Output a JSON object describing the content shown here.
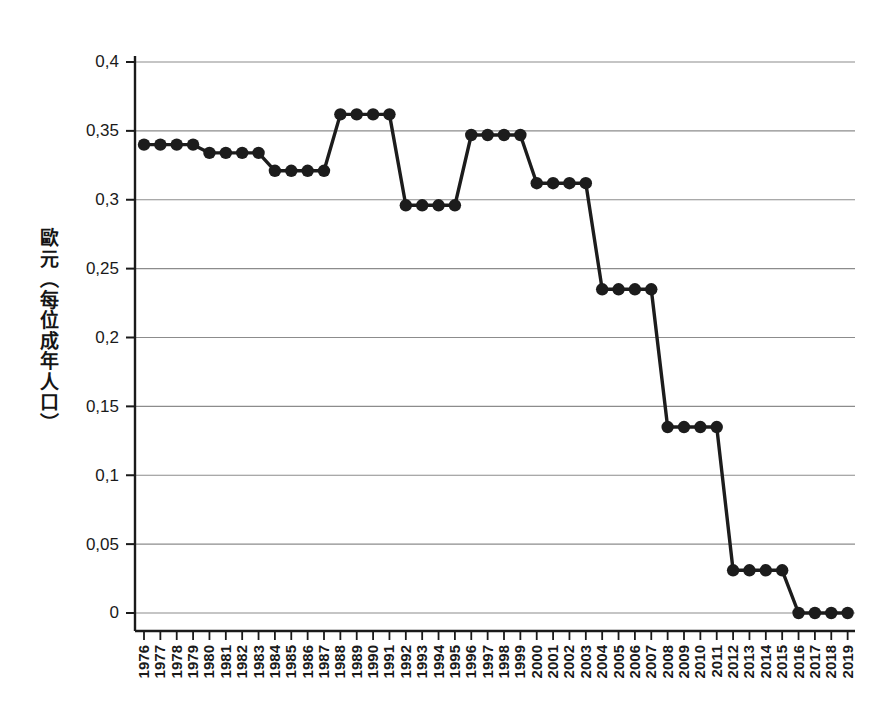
{
  "chart_data": {
    "type": "line",
    "title": "",
    "subtitle": "",
    "xlabel": "",
    "ylabel": "歐元（每位成年人口）",
    "ylim": [
      0,
      0.4
    ],
    "yticks": [
      0,
      0.05,
      0.1,
      0.15,
      0.2,
      0.25,
      0.3,
      0.35,
      0.4
    ],
    "ytick_labels": [
      "0",
      "0,05",
      "0,1",
      "0,15",
      "0,2",
      "0,25",
      "0,3",
      "0,35",
      "0,4"
    ],
    "grid": true,
    "legend": "none",
    "decimal_separator": ",",
    "marker": "filled-circle",
    "line_color": "#1c1c1c",
    "grid_color": "#8c8c8c",
    "categories": [
      "1976",
      "1977",
      "1978",
      "1979",
      "1980",
      "1981",
      "1982",
      "1983",
      "1984",
      "1985",
      "1986",
      "1987",
      "1988",
      "1989",
      "1990",
      "1991",
      "1992",
      "1993",
      "1994",
      "1995",
      "1996",
      "1997",
      "1998",
      "1999",
      "2000",
      "2001",
      "2002",
      "2003",
      "2004",
      "2005",
      "2006",
      "2007",
      "2008",
      "2009",
      "2010",
      "2011",
      "2012",
      "2013",
      "2014",
      "2015",
      "2016",
      "2017",
      "2018",
      "2019"
    ],
    "values": [
      0.34,
      0.34,
      0.34,
      0.34,
      0.334,
      0.334,
      0.334,
      0.334,
      0.321,
      0.321,
      0.321,
      0.321,
      0.362,
      0.362,
      0.362,
      0.362,
      0.296,
      0.296,
      0.296,
      0.296,
      0.347,
      0.347,
      0.347,
      0.347,
      0.312,
      0.312,
      0.312,
      0.312,
      0.235,
      0.235,
      0.235,
      0.235,
      0.135,
      0.135,
      0.135,
      0.135,
      0.031,
      0.031,
      0.031,
      0.031,
      0.0,
      0.0,
      0.0,
      0.0
    ]
  }
}
